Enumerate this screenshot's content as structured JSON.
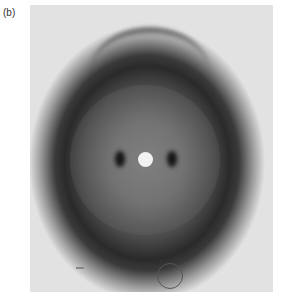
{
  "figure": {
    "panel_label": "(b)",
    "colors": {
      "background": "#e8e8e8",
      "halo_dark": "#2a2a2a",
      "spot": "#151515",
      "beamstop": "#f2f2f2"
    }
  }
}
